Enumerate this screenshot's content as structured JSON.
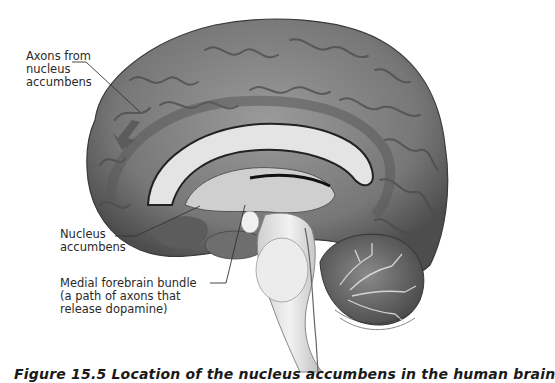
{
  "figure": {
    "labels": [
      {
        "id": "axons",
        "text": "Axons from\nnucleus\naccumbens"
      },
      {
        "id": "nucleus",
        "text": "Nucleus\naccumbens"
      },
      {
        "id": "mfb",
        "text": "Medial forebrain bundle\n(a path of axons that\nrelease dopamine)"
      }
    ],
    "caption": "Figure 15.5  Location of the nucleus accumbens in the human brain",
    "colors": {
      "cortex": "#7a7a7a",
      "cortex_dark": "#4a4a4a",
      "white_matter": "#d9d9d9",
      "brainstem": "#e6e6e6",
      "cerebellum": "#6a6a6a",
      "text": "#2a2a2a"
    }
  }
}
